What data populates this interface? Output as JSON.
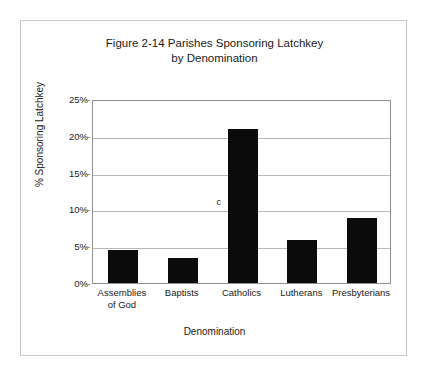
{
  "chart_data": {
    "type": "bar",
    "title": "Figure 2-14 Parishes Sponsoring Latchkey by Denomination",
    "title_lines": [
      "Figure 2-14 Parishes Sponsoring Latchkey",
      "by Denomination"
    ],
    "categories": [
      "Assemblies of God",
      "Baptists",
      "Catholics",
      "Lutherans",
      "Presbyterians"
    ],
    "category_label_lines": [
      [
        "Assemblies",
        "of God"
      ],
      [
        "Baptists",
        ""
      ],
      [
        "Catholics",
        ""
      ],
      [
        "Lutherans",
        ""
      ],
      [
        "Presbyterians",
        ""
      ]
    ],
    "values": [
      4.5,
      3.4,
      20.9,
      5.9,
      8.9
    ],
    "xlabel": "Denomination",
    "ylabel": "% Sponsoring Latchkey",
    "ylim": [
      0,
      25
    ],
    "ytick_values": [
      0,
      5,
      10,
      15,
      20,
      25
    ],
    "ytick_labels": [
      "0%",
      "5%",
      "10%",
      "15%",
      "20%",
      "25%"
    ],
    "grid": true,
    "legend": null,
    "bar_color": "#0b0b0b",
    "gridline_color": "#b8b8b8",
    "axis_color": "#8e8e8e",
    "frame_color": "#c9c9c9",
    "annotations": [
      {
        "text": "c",
        "value_y": 11.2,
        "category_index": 2
      }
    ]
  }
}
